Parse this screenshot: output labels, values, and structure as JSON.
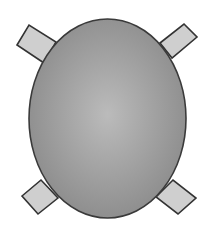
{
  "diagram": {
    "table": {
      "shape": "ellipse",
      "cx": 107.5,
      "cy": 118.5,
      "rx": 78.5,
      "ry": 99.5,
      "fill_center": "#b8b8b8",
      "fill_edge": "#8a8a8a",
      "stroke": "#3a3a3a"
    },
    "chairs": [
      {
        "position": "top-left",
        "points": "17,45 29,25 56,42 44,63"
      },
      {
        "position": "top-right",
        "points": "160,43 184,24 197,37 172,58"
      },
      {
        "position": "bottom-left",
        "points": "22,196 41,180 58,198 38,214"
      },
      {
        "position": "bottom-right",
        "points": "156,197 173,180 196,198 178,214"
      }
    ],
    "chair_fill": "#cfcfcf",
    "chair_stroke": "#333333"
  }
}
